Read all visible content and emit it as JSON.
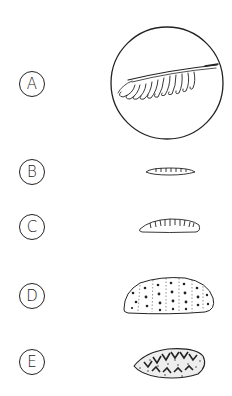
{
  "diagram": {
    "type": "labeled illustration panel",
    "options": [
      {
        "label": "A",
        "figure": "magnified feather-like structure with comb of curled loops shown inside a circle",
        "center": [
          32,
          84
        ]
      },
      {
        "label": "B",
        "figure": "very thin slender segmented larva",
        "center": [
          32,
          172
        ]
      },
      {
        "label": "C",
        "figure": "small segmented larva with ribbed upper surface",
        "center": [
          32,
          227
        ]
      },
      {
        "label": "D",
        "figure": "large plump segmented larva with dotted spots",
        "center": [
          32,
          296
        ]
      },
      {
        "label": "E",
        "figure": "oval larva with dark chevron pattern and stippled texture",
        "center": [
          32,
          362
        ]
      }
    ],
    "colors": {
      "ink": "#222222",
      "background": "#ffffff"
    }
  }
}
